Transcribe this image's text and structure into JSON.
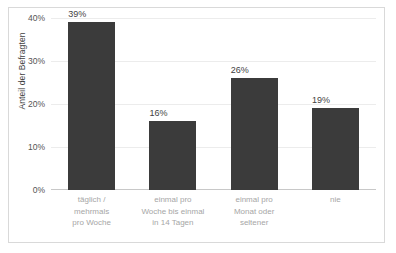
{
  "chart_data": {
    "type": "bar",
    "title": "",
    "xlabel": "",
    "ylabel": "Anteil der Befragten",
    "categories": [
      "täglich / mehrmals pro Woche",
      "einmal pro Woche bis einmal in 14 Tagen",
      "einmal pro Monat oder seltener",
      "nie"
    ],
    "category_lines": [
      [
        "täglich /",
        "mehrmals",
        "pro Woche"
      ],
      [
        "einmal pro",
        "Woche bis einmal",
        "in 14 Tagen"
      ],
      [
        "einmal pro",
        "Monat oder",
        "seltener"
      ],
      [
        "nie"
      ]
    ],
    "values": [
      39,
      16,
      26,
      19
    ],
    "value_labels": [
      "39%",
      "16%",
      "26%",
      "19%"
    ],
    "ylim": [
      0,
      40
    ],
    "yticks": [
      40,
      30,
      20,
      10,
      0
    ],
    "ytick_labels": [
      "40%",
      "30%",
      "20%",
      "10%",
      "0%"
    ],
    "grid": true,
    "legend": "none",
    "bar_color": "#3b3b3b",
    "gridline_color": "#ececec",
    "axis_color": "#c8c8c8",
    "tick_text_color": "#545454",
    "category_text_color": "#a6a6a6",
    "label_text_color": "#3f3f3f",
    "frame_color": "#d9d9d9",
    "background": "#ffffff"
  }
}
